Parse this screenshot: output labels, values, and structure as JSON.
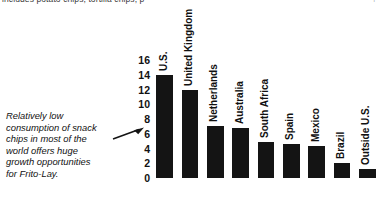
{
  "header_fragment": {
    "text": "includes potato chips, tortilla chips, p",
    "tick": "↑"
  },
  "caption": {
    "lines": [
      "Relatively low",
      "consumption of snack",
      "chips in most of the",
      "world offers huge",
      "growth opportunities",
      "for Frito-Lay."
    ],
    "arrow_icon": "arrow-right-icon"
  },
  "colors": {
    "bar": "#141414",
    "text": "#111111",
    "background": "#ffffff"
  },
  "chart_data": {
    "type": "bar",
    "title": "",
    "xlabel": "",
    "ylabel": "",
    "ylim": [
      0,
      16
    ],
    "yticks": [
      16,
      14,
      12,
      10,
      8,
      6,
      4,
      2,
      0
    ],
    "grid": false,
    "legend": "none",
    "categories": [
      "U.S.",
      "United Kingdom",
      "Netherlands",
      "Australia",
      "South Africa",
      "Spain",
      "Mexico",
      "Brazil",
      "Outside U.S."
    ],
    "values": [
      14.0,
      12.0,
      7.0,
      6.8,
      4.9,
      4.6,
      4.4,
      2.0,
      1.2
    ],
    "annotation": "Relatively low consumption of snack chips in most of the world offers huge growth opportunities for Frito-Lay."
  }
}
